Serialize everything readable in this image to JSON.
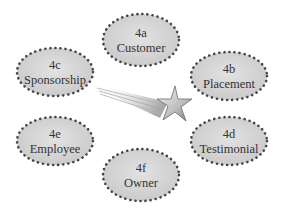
{
  "diagram": {
    "center_icon": "shooting-star-icon",
    "colors": {
      "ellipse_fill": "#d4d4d4",
      "dot_border": "#444444",
      "text": "#333333",
      "star": "#c8c8c8"
    },
    "nodes": [
      {
        "id": "4a",
        "code": "4a",
        "label": "Customer",
        "cx": 141,
        "cy": 40
      },
      {
        "id": "4b",
        "code": "4b",
        "label": "Placement",
        "cx": 229,
        "cy": 76
      },
      {
        "id": "4c",
        "code": "4c",
        "label": "Sponsorship",
        "cx": 55,
        "cy": 72
      },
      {
        "id": "4d",
        "code": "4d",
        "label": "Testimonial",
        "cx": 229,
        "cy": 141
      },
      {
        "id": "4e",
        "code": "4e",
        "label": "Employee",
        "cx": 55,
        "cy": 141
      },
      {
        "id": "4f",
        "code": "4f",
        "label": "Owner",
        "cx": 141,
        "cy": 175
      }
    ]
  }
}
